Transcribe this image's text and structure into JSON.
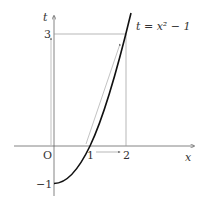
{
  "diagram": {
    "curve_label": "t = x² − 1",
    "axis_x_label": "x",
    "axis_t_label": "t",
    "origin_label": "O",
    "x_ticks": [
      "1",
      "2"
    ],
    "t_ticks": [
      "3",
      "−1"
    ],
    "colors": {
      "curve": "#111111",
      "axes": "#555555",
      "guides": "#888888"
    }
  }
}
